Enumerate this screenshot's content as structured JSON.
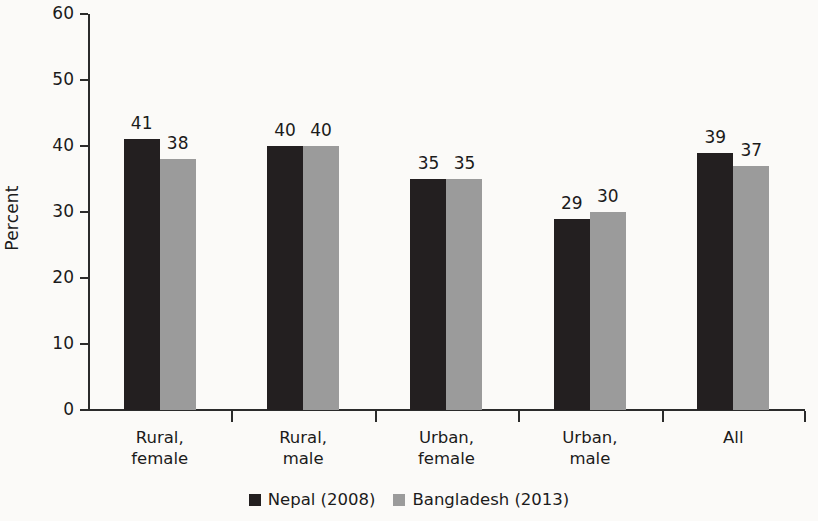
{
  "chart_data": {
    "type": "bar",
    "title": "",
    "subtitle": "",
    "xlabel": "",
    "ylabel": "Percent",
    "ylim": [
      0,
      60
    ],
    "yticks": [
      0,
      10,
      20,
      30,
      40,
      50,
      60
    ],
    "grid": false,
    "legend_position": "bottom",
    "categories": [
      "Rural,\nfemale",
      "Rural,\nmale",
      "Urban,\nfemale",
      "Urban,\nmale",
      "All"
    ],
    "category_lines": [
      [
        "Rural,",
        "female"
      ],
      [
        "Rural,",
        "male"
      ],
      [
        "Urban,",
        "female"
      ],
      [
        "Urban,",
        "male"
      ],
      [
        "All",
        ""
      ]
    ],
    "series": [
      {
        "name": "Nepal (2008)",
        "color": "#231f20",
        "values": [
          41,
          40,
          35,
          29,
          39
        ]
      },
      {
        "name": "Bangladesh (2013)",
        "color": "#9b9b9b",
        "values": [
          38,
          40,
          35,
          30,
          37
        ]
      }
    ]
  },
  "axis": {
    "y_title": "Percent",
    "y_tick_labels": [
      "60",
      "50",
      "40",
      "30",
      "20",
      "10",
      "0"
    ]
  },
  "legend": {
    "items": [
      {
        "label": "Nepal (2008)",
        "swatch": "dark-swatch"
      },
      {
        "label": "Bangladesh (2013)",
        "swatch": "gray-swatch"
      }
    ]
  }
}
